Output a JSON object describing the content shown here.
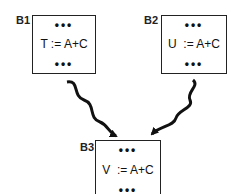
{
  "diagram": {
    "blocks": [
      {
        "id": "B1",
        "label": "B1",
        "top_dots": "•••",
        "statement": "T := A+C",
        "bottom_dots": "•••"
      },
      {
        "id": "B2",
        "label": "B2",
        "top_dots": "•••",
        "statement": "U  := A+C",
        "bottom_dots": "•••"
      },
      {
        "id": "B3",
        "label": "B3",
        "top_dots": "•••",
        "statement": "V  := A+C",
        "bottom_dots": "•••"
      }
    ],
    "edges": [
      {
        "from": "B1",
        "to": "B3",
        "style": "wavy-arrow"
      },
      {
        "from": "B2",
        "to": "B3",
        "style": "wavy-arrow"
      }
    ]
  }
}
